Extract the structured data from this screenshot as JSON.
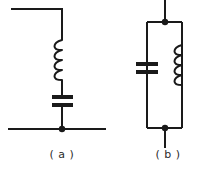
{
  "figure": {
    "background_color": "#ffffff",
    "line_color": "#1a1a1a",
    "captions": {
      "a": "( a )",
      "b": "( b )"
    }
  },
  "circuit_a": {
    "label": "( a )",
    "topology": "series-LC-shunt-to-ground",
    "components": [
      {
        "type": "inductor",
        "name": "inductor-a",
        "turns": 4,
        "orientation": "vertical",
        "bulge_side": "left"
      },
      {
        "type": "capacitor",
        "name": "capacitor-a",
        "plates": 2,
        "orientation": "horizontal-plates"
      }
    ],
    "nodes": [
      {
        "name": "junction-bottom-a",
        "visible_dot": true
      }
    ],
    "wires": [
      {
        "name": "top-lead-a",
        "shape": "horizontal-then-down"
      },
      {
        "name": "bottom-rail-a",
        "shape": "horizontal"
      }
    ]
  },
  "circuit_b": {
    "label": "( b )",
    "topology": "parallel-LC-tank",
    "components": [
      {
        "type": "capacitor",
        "name": "capacitor-b",
        "plates": 2,
        "orientation": "horizontal-plates",
        "branch": "left"
      },
      {
        "type": "inductor",
        "name": "inductor-b",
        "turns": 4,
        "orientation": "vertical",
        "bulge_side": "left",
        "branch": "right"
      }
    ],
    "nodes": [
      {
        "name": "junction-top-b",
        "visible_dot": true
      },
      {
        "name": "junction-bottom-b",
        "visible_dot": true
      }
    ],
    "wires": [
      {
        "name": "top-lead-b",
        "shape": "vertical"
      },
      {
        "name": "bottom-lead-b",
        "shape": "vertical"
      },
      {
        "name": "loop-b",
        "shape": "rectangle"
      }
    ]
  }
}
